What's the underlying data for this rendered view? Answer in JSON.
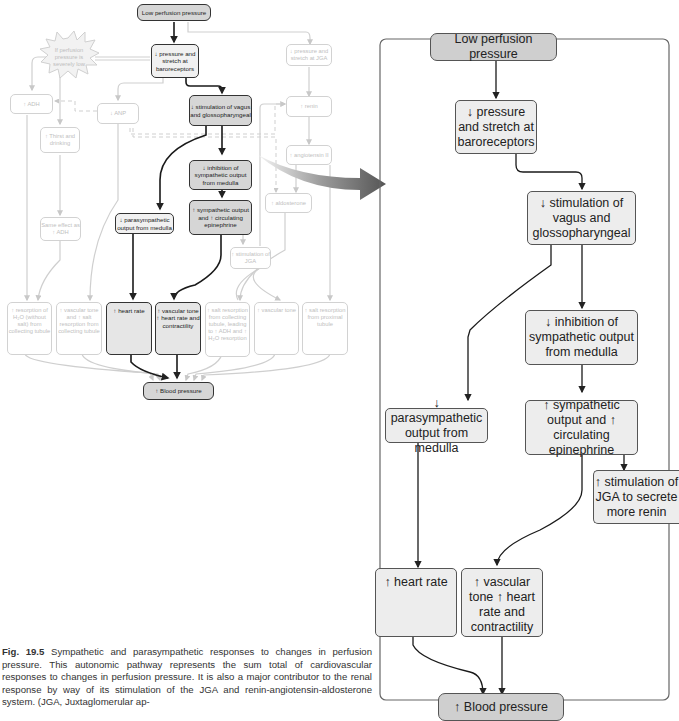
{
  "figure": {
    "number_label": "Fig. 19.5",
    "caption": "Sympathetic and parasympathetic responses to changes in perfusion pressure. This autonomic pathway represents the sum total of cardiovascular responses to changes in perfusion pressure. It is also a major contributor to the renal response by way of its stimulation of the JGA and renin-angiotensin-aldosterone system. (JGA, Juxtaglomerular ap-"
  },
  "overview": {
    "start": "Low perfusion pressure",
    "burst": "If perfusion pressure is severely low",
    "baroreceptors": "↓ pressure and stretch at baroreceptors",
    "jga_stretch": "↓ pressure and stretch at JGA",
    "adh": "↑ ADH",
    "anp": "↓ ANP",
    "thirst": "↑ Thirst and drinking",
    "same_effect": "Same effect as ↑ ADH",
    "vagus": "↓ stimulation of vagus and glossopharyngeal",
    "inhibition": "↓ inhibition of sympathetic output from medulla",
    "parasym": "↓ parasympathetic output from medulla",
    "sympathetic": "↑ sympathetic output and ↑ circulating epinephrine",
    "jga_stim": "↑ stimulation of JGA",
    "renin": "↑ renin",
    "angiotensin": "↑ angiotensin II",
    "aldosterone": "↑ aldosterone",
    "effects": [
      "↑ resorption of H₂O (without salt) from collecting tubule",
      "↑ vascular tone and ↑ salt resorption from collecting tubule",
      "↑ heart rate",
      "↑ vascular tone ↑ heart rate and contractility",
      "↑ salt resorption from collecting tubule, leading to ↑ ADH and ↑ H₂O resorption",
      "↑ vascular tone",
      "↑ salt resorption from proximal tubule"
    ],
    "end": "↑ Blood pressure"
  },
  "detail": {
    "start": "Low perfusion pressure",
    "baroreceptors": "↓ pressure and stretch at baroreceptors",
    "vagus": "↓ stimulation of vagus and glossopharyngeal",
    "inhibition": "↓ inhibition of sympathetic output from medulla",
    "parasym": "↓ parasympathetic output from medulla",
    "sympathetic": "↑ sympathetic output and ↑ circulating epinephrine",
    "jga": "↑ stimulation of JGA to secrete more renin",
    "heart_rate": "↑ heart rate",
    "vascular": "↑ vascular tone ↑ heart rate and contractility",
    "end": "↑ Blood pressure"
  },
  "colors": {
    "dark_box": "#cfcfcf",
    "light_box": "#ededed",
    "faded": "#d2d2d2",
    "arrow_start": "#f0f0f0",
    "arrow_end": "#555555"
  }
}
